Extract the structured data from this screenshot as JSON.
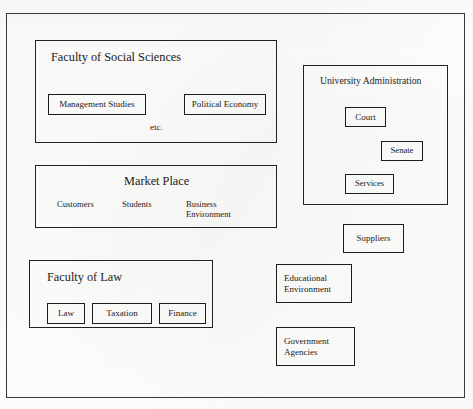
{
  "diagram": {
    "title": "",
    "outer_frame": {
      "name": "diagram-outer-frame"
    },
    "groups": [
      {
        "id": "faculty-of-social-sciences",
        "title": "Faculty of Social Sciences",
        "children": [
          {
            "id": "management-studies",
            "label": "Management Studies"
          },
          {
            "id": "political-economy",
            "label": "Political Economy"
          }
        ],
        "notes": [
          {
            "id": "etc",
            "label": "etc."
          }
        ]
      },
      {
        "id": "university-administration",
        "title": "University Administration",
        "children": [
          {
            "id": "court",
            "label": "Court"
          },
          {
            "id": "senate",
            "label": "Senate"
          },
          {
            "id": "services",
            "label": "Services"
          }
        ],
        "notes": []
      },
      {
        "id": "market-place",
        "title": "Market Place",
        "children": [],
        "notes": [
          {
            "id": "customers",
            "label": "Customers"
          },
          {
            "id": "students",
            "label": "Students"
          },
          {
            "id": "business-environment",
            "label": "Business\nEnvironment"
          }
        ]
      },
      {
        "id": "faculty-of-law",
        "title": "Faculty of Law",
        "children": [
          {
            "id": "law",
            "label": "Law"
          },
          {
            "id": "taxation",
            "label": "Taxation"
          },
          {
            "id": "finance",
            "label": "Finance"
          }
        ],
        "notes": []
      }
    ],
    "standalone_boxes": [
      {
        "id": "suppliers",
        "label": "Suppliers"
      },
      {
        "id": "educational-environment",
        "label": "Educational\nEnvironment"
      },
      {
        "id": "government-agencies",
        "label": "Government\nAgencies"
      }
    ],
    "colors": {
      "line": "#222222",
      "text": "#1b1b1b",
      "background": "#fdfdfc"
    }
  }
}
